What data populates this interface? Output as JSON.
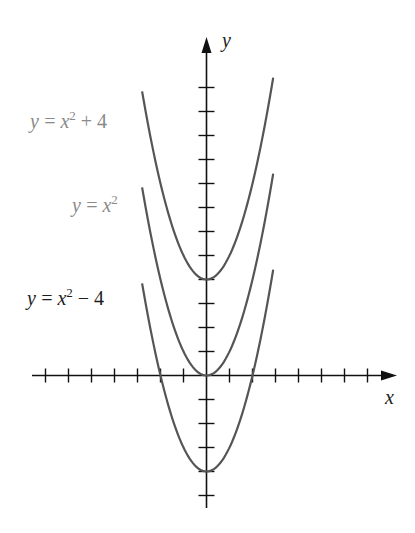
{
  "chart_data": {
    "type": "line",
    "title": "",
    "xlabel": "x",
    "ylabel": "y",
    "xlim": [
      -7.5,
      8.2
    ],
    "ylim": [
      -5.6,
      14
    ],
    "x_ticks": [
      -7,
      -6,
      -5,
      -4,
      -3,
      -2,
      -1,
      1,
      2,
      3,
      4,
      5,
      6,
      7
    ],
    "y_ticks": [
      -5,
      -4,
      -3,
      -2,
      -1,
      1,
      2,
      3,
      4,
      5,
      6,
      7,
      8,
      9,
      10,
      11,
      12
    ],
    "tick_labels_shown": false,
    "grid": false,
    "legend_position": "inline-left",
    "series": [
      {
        "name": "y = x² + 4",
        "label_main": "y = x",
        "label_sup": "2",
        "label_tail": " + 4",
        "shift": 4,
        "x_range": [
          -2.8,
          2.9
        ],
        "color": "#555555",
        "label_color": "#8a8a8a"
      },
      {
        "name": "y = x²",
        "label_main": "y = x",
        "label_sup": "2",
        "label_tail": "",
        "shift": 0,
        "x_range": [
          -2.8,
          2.9
        ],
        "color": "#555555",
        "label_color": "#8a8a8a"
      },
      {
        "name": "y = x² − 4",
        "label_main": "y = x",
        "label_sup": "2",
        "label_tail": " − 4",
        "shift": -4,
        "x_range": [
          -2.8,
          2.9
        ],
        "color": "#555555",
        "label_color": "#1e1e1e"
      }
    ]
  },
  "layout": {
    "origin_px": [
      206.5,
      375.5
    ],
    "x_unit_px": 23,
    "y_unit_px": 24,
    "x_axis_px": [
      32,
      397
    ],
    "y_axis_px": [
      508,
      37
    ],
    "label_pos": [
      [
        30,
        128
      ],
      [
        72,
        212
      ],
      [
        27,
        305
      ]
    ]
  }
}
